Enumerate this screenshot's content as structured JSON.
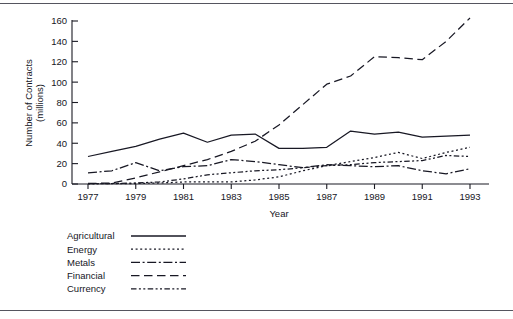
{
  "figure": {
    "top_rule": "horizontal-rule",
    "bottom_rule": "horizontal-rule"
  },
  "chart_data": {
    "type": "line",
    "title": "",
    "subtitle": "",
    "xlabel": "Year",
    "ylabel": "Number of Contracts\n(millions)",
    "ylabel_line1": "Number of Contracts",
    "ylabel_line2": "(millions)",
    "grid": false,
    "legend_position": "below-plot-left",
    "xlim": [
      1977,
      1993
    ],
    "ylim": [
      0,
      160
    ],
    "yticks": [
      0,
      20,
      40,
      60,
      80,
      100,
      120,
      140,
      160
    ],
    "ytick_labels": [
      "0",
      "20",
      "40",
      "60",
      "80",
      "100",
      "120",
      "140",
      "160"
    ],
    "xticks": [
      1977,
      1979,
      1981,
      1983,
      1985,
      1987,
      1989,
      1991,
      1993
    ],
    "xtick_labels": [
      "1977",
      "1979",
      "1981",
      "1983",
      "1985",
      "1987",
      "1989",
      "1991",
      "1993"
    ],
    "x": [
      1977,
      1978,
      1979,
      1980,
      1981,
      1982,
      1983,
      1984,
      1985,
      1986,
      1987,
      1988,
      1989,
      1990,
      1991,
      1992,
      1993
    ],
    "series": [
      {
        "name": "Agricultural",
        "dash": "solid",
        "dasharray": "",
        "color": "#181824",
        "values": [
          27,
          32,
          37,
          44,
          50,
          41,
          48,
          49,
          35,
          35,
          36,
          52,
          49,
          51,
          46,
          47,
          48
        ]
      },
      {
        "name": "Energy",
        "dash": "dotted",
        "dasharray": "2,2.6",
        "color": "#181824",
        "values": [
          0.2,
          0.3,
          0.5,
          1,
          2,
          2,
          2,
          4,
          7,
          13,
          18,
          22,
          26,
          31,
          25,
          31,
          36
        ]
      },
      {
        "name": "Metals",
        "dash": "dash-dot",
        "dasharray": "9,2.6,2,2.6",
        "color": "#181824",
        "values": [
          11,
          13,
          21,
          13,
          17,
          18,
          24,
          22,
          19,
          16,
          19,
          18,
          17,
          18,
          13,
          10,
          15
        ]
      },
      {
        "name": "Financial",
        "dash": "long-dash",
        "dasharray": "8.5,4.5",
        "color": "#181824",
        "values": [
          0.5,
          1,
          6,
          12,
          18,
          24,
          32,
          42,
          58,
          78,
          98,
          106,
          125,
          124,
          122,
          140,
          163
        ]
      },
      {
        "name": "Currency",
        "dash": "dash-dot-dot",
        "dasharray": "5.5,2.4,2,2.4,2,2.4",
        "color": "#181824",
        "values": [
          0.3,
          0.5,
          1,
          2,
          5,
          9,
          11,
          13,
          14,
          16,
          18,
          19,
          21,
          22,
          23,
          28,
          27
        ]
      }
    ]
  },
  "legend": {
    "items": [
      {
        "label": "Agricultural"
      },
      {
        "label": "Energy"
      },
      {
        "label": "Metals"
      },
      {
        "label": "Financial"
      },
      {
        "label": "Currency"
      }
    ]
  }
}
